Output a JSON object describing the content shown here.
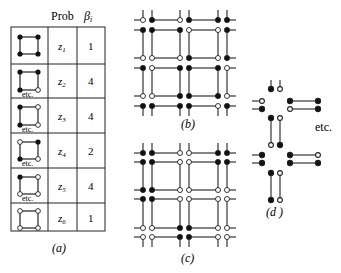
{
  "panel_a": {
    "caption": "(a)",
    "header_prob": "Prob",
    "header_beta": "β",
    "header_beta_sub": "i",
    "rows": [
      {
        "config": "all-filled",
        "prob": "z",
        "prob_sub": "1",
        "beta": "1",
        "etc": ""
      },
      {
        "config": "three-filled-one-open",
        "prob": "z",
        "prob_sub": "2",
        "beta": "4",
        "etc": "etc."
      },
      {
        "config": "two-filled-adjacent",
        "prob": "z",
        "prob_sub": "3",
        "beta": "4",
        "etc": "etc."
      },
      {
        "config": "two-filled-diagonal",
        "prob": "z",
        "prob_sub": "4",
        "beta": "2",
        "etc": "etc."
      },
      {
        "config": "one-filled",
        "prob": "z",
        "prob_sub": "5",
        "beta": "4",
        "etc": "etc."
      },
      {
        "config": "all-open",
        "prob": "z",
        "prob_sub": "6",
        "beta": "1",
        "etc": ""
      }
    ]
  },
  "panel_b": {
    "caption": "(b)",
    "node_rows": [
      [
        "o",
        "f",
        "o",
        "f",
        "f",
        "f"
      ],
      [
        "f",
        "f",
        "f",
        "o",
        "o",
        "f"
      ],
      [
        "o",
        "o",
        "o",
        "f",
        "o",
        "f"
      ],
      [
        "f",
        "o",
        "f",
        "f",
        "f",
        "o"
      ],
      [
        "o",
        "o",
        "f",
        "f",
        "f",
        "o"
      ],
      [
        "f",
        "f",
        "f",
        "f",
        "o",
        "f"
      ]
    ]
  },
  "panel_c": {
    "caption": "(c)",
    "node_rows": [
      [
        "f",
        "f",
        "o",
        "o",
        "f",
        "f"
      ],
      [
        "f",
        "f",
        "o",
        "o",
        "f",
        "f"
      ],
      [
        "f",
        "f",
        "o",
        "o",
        "o",
        "o"
      ],
      [
        "f",
        "f",
        "o",
        "o",
        "o",
        "o"
      ],
      [
        "o",
        "o",
        "f",
        "f",
        "o",
        "o"
      ],
      [
        "o",
        "o",
        "f",
        "f",
        "o",
        "o"
      ]
    ]
  },
  "panel_d": {
    "caption": "(d )",
    "etc_label": "etc."
  }
}
